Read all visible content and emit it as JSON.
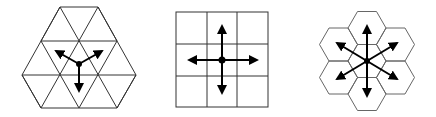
{
  "figure": {
    "panels": [
      {
        "name": "triangular-grid",
        "directions": 3
      },
      {
        "name": "square-grid",
        "directions": 4
      },
      {
        "name": "hexagonal-grid",
        "directions": 6
      }
    ],
    "colors": {
      "stroke": "#222222",
      "arrow": "#000000",
      "background": "#ffffff"
    }
  }
}
